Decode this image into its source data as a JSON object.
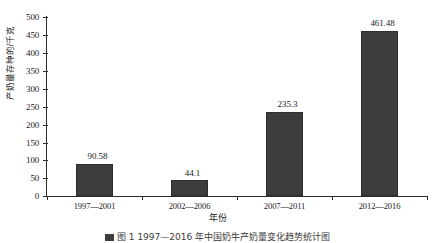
{
  "chart_data": {
    "type": "bar",
    "title": "",
    "categories": [
      "1997—2001",
      "2002—2006",
      "2007—2011",
      "2012—2016"
    ],
    "values": [
      90.58,
      44.1,
      235.3,
      461.48
    ],
    "value_labels": [
      "90.58",
      "44.1",
      "235.3",
      "461.48"
    ],
    "series": [
      {
        "name": "产奶量",
        "values": [
          90.58,
          44.1,
          235.3,
          461.48
        ]
      }
    ],
    "xlabel": "年份",
    "ylabel": "产奶量存种的/千克",
    "ylim": [
      0,
      500
    ],
    "yticks": [
      0,
      50,
      100,
      150,
      200,
      250,
      300,
      350,
      400,
      450,
      500
    ],
    "ytick_labels": [
      "0",
      "50",
      "100",
      "150",
      "200",
      "250",
      "300",
      "350",
      "400",
      "450",
      "500"
    ],
    "grid": false,
    "legend": false,
    "bar_color": "#3d3d3d",
    "axis_color": "#2b2b2b",
    "background": "#ffffff"
  },
  "caption": {
    "text": "图 1  1997—2016 年中国奶牛产奶量变化趋势统计图"
  }
}
